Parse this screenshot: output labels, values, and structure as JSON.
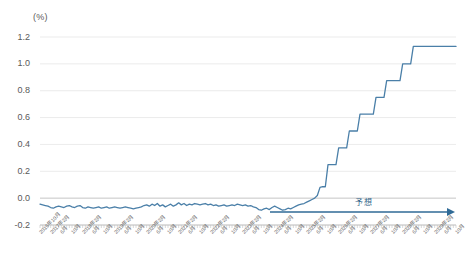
{
  "unit_label": "(%)",
  "annotation": {
    "forecast_text": "予想",
    "forecast_text_x": 355,
    "forecast_text_y": 196,
    "arrow_x_start": 270,
    "arrow_x_end": 455,
    "arrow_y": 212
  },
  "colors": {
    "line": "#4a7fa8",
    "arrow": "#2f6a96",
    "grid": "#e6e6e6",
    "axis": "#bfbfbf",
    "tick_text": "#595959",
    "xtick_text": "#666666",
    "background": "#ffffff"
  },
  "chart_data": {
    "type": "line",
    "title": "",
    "subtitle": "",
    "xlabel": "",
    "ylabel": "(%)",
    "ylim": [
      -0.2,
      1.2
    ],
    "ytick_values": [
      1.2,
      1.0,
      0.8,
      0.6,
      0.4,
      0.2,
      0.0,
      -0.2
    ],
    "ytick_labels": [
      "1.2",
      "1.0",
      "0.8",
      "0.6",
      "0.4",
      "0.2",
      "0.0",
      "-0.2"
    ],
    "grid": true,
    "legend": false,
    "zero_line": 0.0,
    "x_tick_interval_months": 4,
    "xtick_labels": [
      "2016年10月",
      "2017年2月",
      "6月",
      "10月",
      "2018年2月",
      "6月",
      "10月",
      "2019年2月",
      "6月",
      "10月",
      "2020年2月",
      "6月",
      "10月",
      "2021年2月",
      "6月",
      "10月",
      "2022年2月",
      "6月",
      "10月",
      "2023年2月",
      "6月",
      "10月",
      "2024年2月",
      "6月",
      "10月",
      "2025年2月",
      "6月",
      "10月",
      "2026年2月",
      "6月",
      "10月",
      "2027年2月",
      "6月",
      "10月",
      "2028年2月",
      "6月",
      "10月",
      "2029年2月",
      "6月",
      "10月"
    ],
    "x_start": "2016-10",
    "x_end": "2029-10",
    "forecast_start": "2024-06",
    "series": [
      {
        "name": "金利",
        "color": "#4a7fa8",
        "values": [
          -0.045,
          -0.05,
          -0.055,
          -0.06,
          -0.07,
          -0.075,
          -0.065,
          -0.06,
          -0.065,
          -0.07,
          -0.06,
          -0.055,
          -0.065,
          -0.07,
          -0.06,
          -0.055,
          -0.07,
          -0.075,
          -0.065,
          -0.07,
          -0.075,
          -0.07,
          -0.065,
          -0.075,
          -0.07,
          -0.065,
          -0.075,
          -0.07,
          -0.065,
          -0.07,
          -0.075,
          -0.07,
          -0.065,
          -0.07,
          -0.075,
          -0.08,
          -0.075,
          -0.07,
          -0.065,
          -0.055,
          -0.05,
          -0.06,
          -0.045,
          -0.055,
          -0.04,
          -0.06,
          -0.05,
          -0.065,
          -0.055,
          -0.045,
          -0.06,
          -0.05,
          -0.035,
          -0.05,
          -0.04,
          -0.055,
          -0.045,
          -0.05,
          -0.04,
          -0.045,
          -0.05,
          -0.045,
          -0.04,
          -0.05,
          -0.045,
          -0.055,
          -0.05,
          -0.06,
          -0.055,
          -0.05,
          -0.06,
          -0.055,
          -0.05,
          -0.055,
          -0.045,
          -0.05,
          -0.055,
          -0.05,
          -0.06,
          -0.055,
          -0.065,
          -0.07,
          -0.085,
          -0.09,
          -0.08,
          -0.075,
          -0.085,
          -0.07,
          -0.06,
          -0.07,
          -0.08,
          -0.09,
          -0.085,
          -0.075,
          -0.08,
          -0.07,
          -0.06,
          -0.05,
          -0.045,
          -0.04,
          -0.03,
          -0.02,
          -0.01,
          0.0,
          0.02,
          0.08,
          0.085,
          0.085,
          0.25,
          0.25,
          0.25,
          0.25,
          0.375,
          0.375,
          0.375,
          0.375,
          0.5,
          0.5,
          0.5,
          0.5,
          0.625,
          0.625,
          0.625,
          0.625,
          0.625,
          0.625,
          0.75,
          0.75,
          0.75,
          0.75,
          0.875,
          0.875,
          0.875,
          0.875,
          0.875,
          0.875,
          1.0,
          1.0,
          1.0,
          1.0,
          1.13,
          1.13,
          1.13,
          1.13,
          1.13,
          1.13,
          1.13,
          1.13,
          1.13,
          1.13,
          1.13,
          1.13,
          1.13,
          1.13,
          1.13,
          1.13,
          1.13
        ]
      }
    ]
  }
}
